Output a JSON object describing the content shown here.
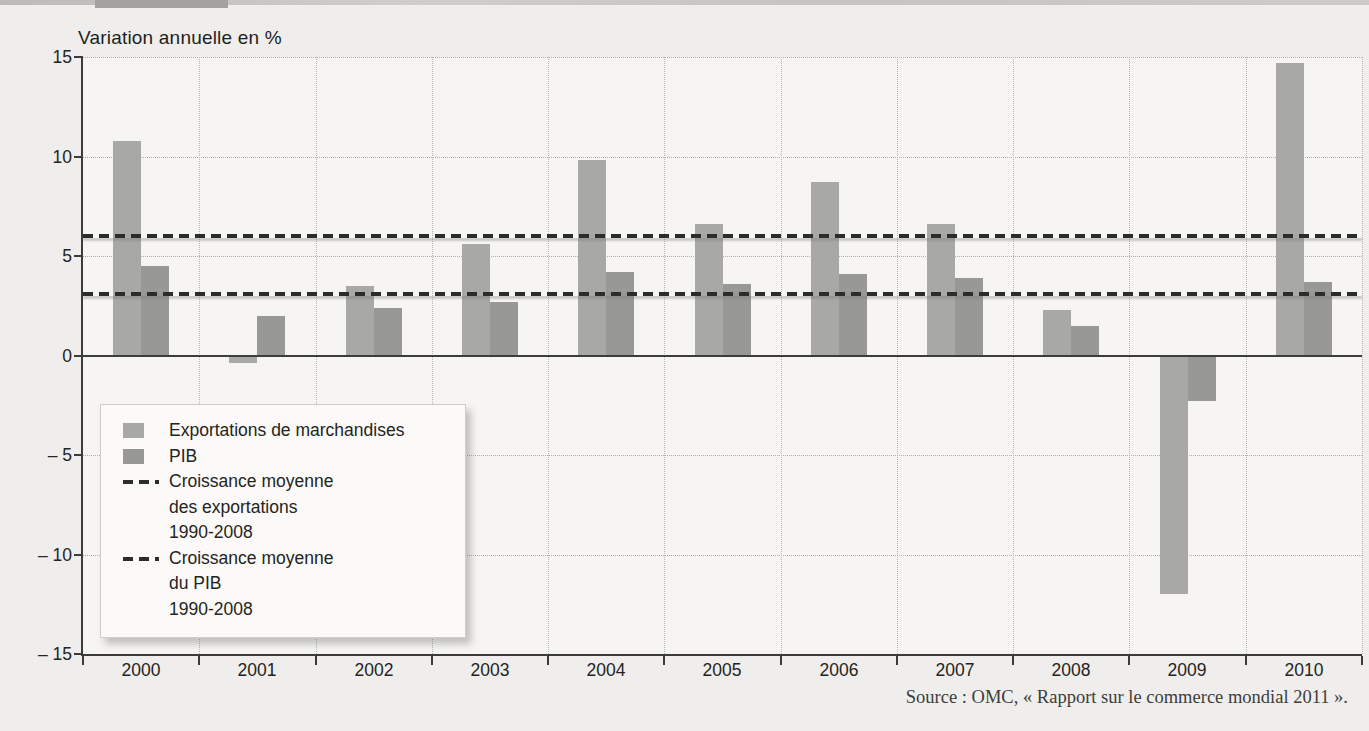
{
  "chart_data": {
    "type": "bar",
    "title": "Variation annuelle en %",
    "categories": [
      "2000",
      "2001",
      "2002",
      "2003",
      "2004",
      "2005",
      "2006",
      "2007",
      "2008",
      "2009",
      "2010"
    ],
    "series": [
      {
        "name": "Exportations de marchandises",
        "values": [
          10.8,
          -0.4,
          3.5,
          5.6,
          9.8,
          6.6,
          8.7,
          6.6,
          2.3,
          -12.0,
          14.7
        ],
        "color": "#a8a8a6"
      },
      {
        "name": "PIB",
        "values": [
          4.5,
          2.0,
          2.4,
          2.7,
          4.2,
          3.6,
          4.1,
          3.9,
          1.5,
          -2.3,
          3.7
        ],
        "color": "#98989",
        "color_fix": "#989896"
      }
    ],
    "reference_lines": [
      {
        "name": "Croissance moyenne des exportations 1990-2008",
        "value": 6.0
      },
      {
        "name": "Croissance moyenne du PIB 1990-2008",
        "value": 3.1
      }
    ],
    "reference_line_color": "#2c2c2a",
    "ylim": [
      -15,
      15
    ],
    "yticks": [
      {
        "value": 15,
        "label": "15"
      },
      {
        "value": 10,
        "label": "10"
      },
      {
        "value": 5,
        "label": "5"
      },
      {
        "value": 0,
        "label": "0"
      },
      {
        "value": -5,
        "label": "– 5"
      },
      {
        "value": -10,
        "label": "– 10"
      },
      {
        "value": -15,
        "label": "– 15"
      }
    ],
    "grid": true,
    "legend_position": "inside-left",
    "xlabel": "",
    "ylabel": "Variation annuelle en %"
  },
  "legend": {
    "exports_label": "Exportations de marchandises",
    "pib_label": "PIB",
    "avg_exports": {
      "line1": "Croissance moyenne",
      "line2": "des exportations",
      "line3": "1990-2008"
    },
    "avg_pib": {
      "line1": "Croissance moyenne",
      "line2": "du PIB",
      "line3": "1990-2008"
    }
  },
  "footer": {
    "source": "Source : OMC, « Rapport sur le commerce mondial 2011 »."
  }
}
